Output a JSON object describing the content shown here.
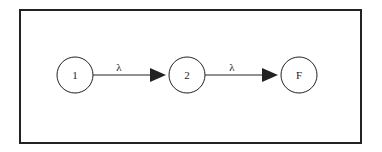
{
  "diagram": {
    "type": "state-transition",
    "nodes": [
      {
        "id": "1",
        "label": "1",
        "cx": 75,
        "cy": 75
      },
      {
        "id": "2",
        "label": "2",
        "cx": 187,
        "cy": 75
      },
      {
        "id": "F",
        "label": "F",
        "cx": 299,
        "cy": 75
      }
    ],
    "edges": [
      {
        "from": "1",
        "to": "2",
        "label": "λ"
      },
      {
        "from": "2",
        "to": "F",
        "label": "λ"
      }
    ],
    "colors": {
      "stroke": "#222222",
      "background": "#ffffff"
    }
  }
}
